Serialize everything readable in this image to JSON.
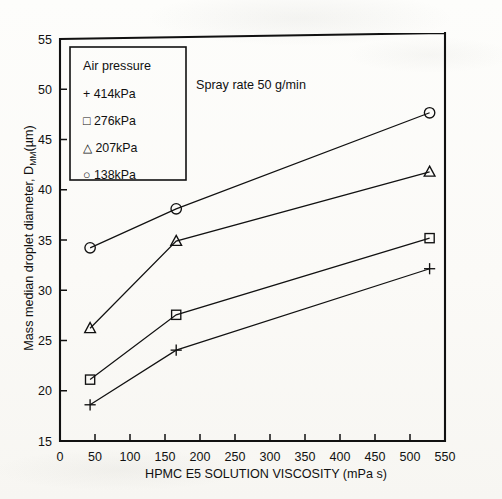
{
  "chart_data": {
    "type": "line",
    "title": "",
    "xlabel": "HPMC E5 SOLUTION VISCOSITY (mPa s)",
    "ylabel_main": "Mass median droplet diameter, D",
    "ylabel_sub": "MM",
    "ylabel_unit": "(µm)",
    "xlim": [
      0,
      550
    ],
    "ylim": [
      15,
      55
    ],
    "xticks": [
      0,
      50,
      100,
      150,
      200,
      250,
      300,
      350,
      400,
      450,
      500,
      550
    ],
    "yticks": [
      15,
      20,
      25,
      30,
      35,
      40,
      45,
      50,
      55
    ],
    "grid": false,
    "legend_position": "top-left",
    "legend_title": "Air pressure",
    "annotation": "Spray rate 50 g/min",
    "x": [
      43,
      166,
      528
    ],
    "series": [
      {
        "name": "414kPa",
        "marker": "plus",
        "values": [
          18.6,
          24.0,
          31.9
        ]
      },
      {
        "name": "276kPa",
        "marker": "square",
        "values": [
          21.1,
          27.5,
          34.9
        ]
      },
      {
        "name": "207kPa",
        "marker": "triangle",
        "values": [
          26.2,
          34.8,
          41.4
        ]
      },
      {
        "name": "138kPa",
        "marker": "circle",
        "values": [
          34.2,
          38.0,
          47.2
        ]
      }
    ]
  },
  "figure": {
    "xtick_labels": [
      "0",
      "50",
      "100",
      "150",
      "200",
      "250",
      "300",
      "350",
      "400",
      "450",
      "500",
      "550"
    ],
    "ytick_labels": [
      "15",
      "20",
      "25",
      "30",
      "35",
      "40",
      "45",
      "50",
      "55"
    ],
    "legend_entries": [
      {
        "glyph": "+",
        "label": "414kPa"
      },
      {
        "glyph": "□",
        "label": "276kPa"
      },
      {
        "glyph": "△",
        "label": "207kPa"
      },
      {
        "glyph": "○",
        "label": "138kPa"
      }
    ]
  }
}
